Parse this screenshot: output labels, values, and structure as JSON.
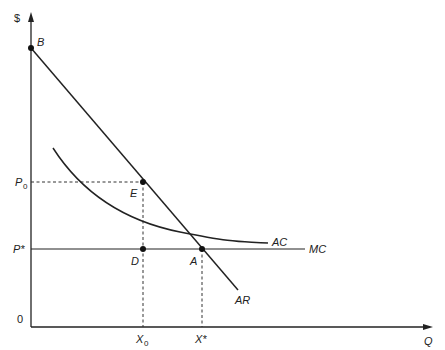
{
  "diagram": {
    "axes": {
      "y_label": "$",
      "x_label": "Q",
      "origin_label": "0"
    },
    "price_labels": {
      "p0": "P",
      "p0_sub": "0",
      "pstar": "P*"
    },
    "quantity_labels": {
      "x0": "X",
      "x0_sub": "0",
      "xstar": "X*"
    },
    "points": {
      "B": "B",
      "E": "E",
      "D": "D",
      "A": "A"
    },
    "curves": {
      "AR": "AR",
      "AC": "AC",
      "MC": "MC"
    },
    "colors": {
      "line": "#222222",
      "background": "#ffffff"
    }
  }
}
